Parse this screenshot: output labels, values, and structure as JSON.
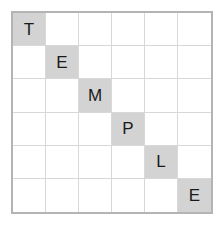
{
  "puzzle": {
    "type": "letter-grid",
    "rows": 6,
    "columns": 6,
    "word": "TEMPLE",
    "colors": {
      "background": "#ffffff",
      "outer_border": "#b4b4b4",
      "grid_line": "#d8d8d8",
      "filled_cell": "#d3d3d3",
      "letter": "#1a1a1a"
    },
    "cells": [
      [
        {
          "letter": "T",
          "filled": true
        },
        {
          "letter": "",
          "filled": false
        },
        {
          "letter": "",
          "filled": false
        },
        {
          "letter": "",
          "filled": false
        },
        {
          "letter": "",
          "filled": false
        },
        {
          "letter": "",
          "filled": false
        }
      ],
      [
        {
          "letter": "",
          "filled": false
        },
        {
          "letter": "E",
          "filled": true
        },
        {
          "letter": "",
          "filled": false
        },
        {
          "letter": "",
          "filled": false
        },
        {
          "letter": "",
          "filled": false
        },
        {
          "letter": "",
          "filled": false
        }
      ],
      [
        {
          "letter": "",
          "filled": false
        },
        {
          "letter": "",
          "filled": false
        },
        {
          "letter": "M",
          "filled": true
        },
        {
          "letter": "",
          "filled": false
        },
        {
          "letter": "",
          "filled": false
        },
        {
          "letter": "",
          "filled": false
        }
      ],
      [
        {
          "letter": "",
          "filled": false
        },
        {
          "letter": "",
          "filled": false
        },
        {
          "letter": "",
          "filled": false
        },
        {
          "letter": "P",
          "filled": true
        },
        {
          "letter": "",
          "filled": false
        },
        {
          "letter": "",
          "filled": false
        }
      ],
      [
        {
          "letter": "",
          "filled": false
        },
        {
          "letter": "",
          "filled": false
        },
        {
          "letter": "",
          "filled": false
        },
        {
          "letter": "",
          "filled": false
        },
        {
          "letter": "L",
          "filled": true
        },
        {
          "letter": "",
          "filled": false
        }
      ],
      [
        {
          "letter": "",
          "filled": false
        },
        {
          "letter": "",
          "filled": false
        },
        {
          "letter": "",
          "filled": false
        },
        {
          "letter": "",
          "filled": false
        },
        {
          "letter": "",
          "filled": false
        },
        {
          "letter": "E",
          "filled": true
        }
      ]
    ]
  }
}
